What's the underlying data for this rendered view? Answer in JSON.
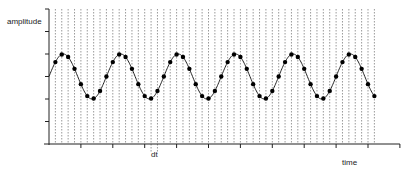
{
  "chart_data": {
    "type": "line",
    "title": "",
    "xlabel": "time",
    "ylabel": "amplitude",
    "annotations": [
      {
        "text": "dt",
        "description": "sampling interval between adjacent dashed lines"
      }
    ],
    "xlim": [
      0,
      11
    ],
    "ylim": [
      0,
      6
    ],
    "x_ticks": [
      0,
      1,
      2,
      3,
      4,
      5,
      6,
      7,
      8,
      9,
      10,
      11
    ],
    "y_ticks": [
      0,
      1,
      2,
      3,
      4,
      5,
      6
    ],
    "tick_labels_shown": false,
    "grid": "vertical dashed lines at each sample time",
    "signal": {
      "form": "sine",
      "offset": 3,
      "amplitude": 1,
      "period": 1.8,
      "phase": 0
    },
    "sample_interval": 0.2,
    "sample_start": 0.2,
    "sample_count": 51,
    "dt_marker_between": [
      3.2,
      3.4
    ],
    "series": [
      {
        "name": "sampled signal",
        "marker": "circle",
        "x": [
          0.2,
          0.4,
          0.6,
          0.8,
          1.0,
          1.2,
          1.4,
          1.6,
          1.8,
          2.0,
          2.2,
          2.4,
          2.6,
          2.8,
          3.0,
          3.2,
          3.4,
          3.6,
          3.8,
          4.0,
          4.2,
          4.4,
          4.6,
          4.8,
          5.0,
          5.2,
          5.4,
          5.6,
          5.8,
          6.0,
          6.2,
          6.4,
          6.6,
          6.8,
          7.0,
          7.2,
          7.4,
          7.6,
          7.8,
          8.0,
          8.2,
          8.4,
          8.6,
          8.8,
          9.0,
          9.2,
          9.4,
          9.6,
          9.8,
          10.0,
          10.2
        ],
        "values": [
          3.64,
          3.98,
          3.87,
          3.34,
          2.66,
          2.13,
          2.02,
          2.36,
          3.0,
          3.64,
          3.98,
          3.87,
          3.34,
          2.66,
          2.13,
          2.02,
          2.36,
          3.0,
          3.64,
          3.98,
          3.87,
          3.34,
          2.66,
          2.13,
          2.02,
          2.36,
          3.0,
          3.64,
          3.98,
          3.87,
          3.34,
          2.66,
          2.13,
          2.02,
          2.36,
          3.0,
          3.64,
          3.98,
          3.87,
          3.34,
          2.66,
          2.13,
          2.02,
          2.36,
          3.0,
          3.64,
          3.98,
          3.87,
          3.34,
          2.66,
          2.13
        ]
      }
    ]
  },
  "labels": {
    "ylabel": "amplitude",
    "xlabel": "time",
    "dt": "dt"
  },
  "colors": {
    "axis": "#222222",
    "grid": "#555555",
    "line": "#222222",
    "marker": "#000000"
  }
}
